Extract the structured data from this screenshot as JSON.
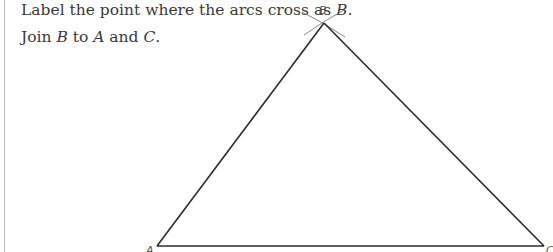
{
  "instructions": {
    "line1": {
      "text_before": "Label the point where the arcs cross as ",
      "var": "B",
      "text_after": "."
    },
    "line2": {
      "t1": "Join ",
      "v1": "B",
      "t2": " to ",
      "v2": "A",
      "t3": " and ",
      "v3": "C",
      "t4": "."
    }
  },
  "diagram": {
    "labels": {
      "A": "A",
      "B": "B",
      "C": "C"
    },
    "points": {
      "A": [
        157,
        246
      ],
      "B": [
        324,
        23
      ],
      "C": [
        544,
        246
      ]
    },
    "arcs": [
      {
        "from": [
          302,
          12
        ],
        "to": [
          345,
          37
        ]
      },
      {
        "from": [
          344,
          10
        ],
        "to": [
          304,
          35
        ]
      }
    ],
    "colors": {
      "line": "#2b2b2b",
      "arc": "#7a7a7a",
      "label": "#555555"
    }
  }
}
